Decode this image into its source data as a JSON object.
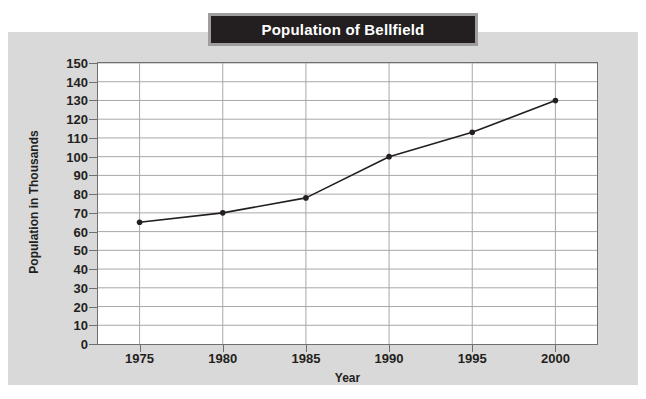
{
  "chart_data": {
    "type": "line",
    "title": "Population of Bellfield",
    "xlabel": "Year",
    "ylabel": "Population in Thousands",
    "x": [
      1975,
      1980,
      1985,
      1990,
      1995,
      2000
    ],
    "categories": [
      "1975",
      "1980",
      "1985",
      "1990",
      "1995",
      "2000"
    ],
    "values": [
      65,
      70,
      78,
      100,
      113,
      130
    ],
    "series": [
      {
        "name": "Population of Bellfield",
        "values": [
          65,
          70,
          78,
          100,
          113,
          130
        ]
      }
    ],
    "xlim": [
      1972.5,
      2002.5
    ],
    "ylim": [
      0,
      150
    ],
    "ytick_labels": [
      "0",
      "10",
      "20",
      "30",
      "40",
      "50",
      "60",
      "70",
      "80",
      "90",
      "100",
      "110",
      "120",
      "130",
      "140",
      "150"
    ],
    "ytick_values": [
      0,
      10,
      20,
      30,
      40,
      50,
      60,
      70,
      80,
      90,
      100,
      110,
      120,
      130,
      140,
      150
    ],
    "xtick_labels": [
      "1975",
      "1980",
      "1985",
      "1990",
      "1995",
      "2000"
    ],
    "grid": true,
    "grid_axis": "both",
    "legend": false,
    "legend_position": "none",
    "markers": "filled-circle",
    "colors": {
      "line": "#231f20",
      "marker": "#231f20",
      "grid": "#a8a8a8",
      "axis": "#6f6f6f",
      "plot_background": "#ffffff",
      "panel_background": "#d9d9d9",
      "title_background": "#231f20",
      "title_border": "#9e9e9e",
      "title_text": "#ffffff",
      "tick_text": "#231f20"
    }
  }
}
